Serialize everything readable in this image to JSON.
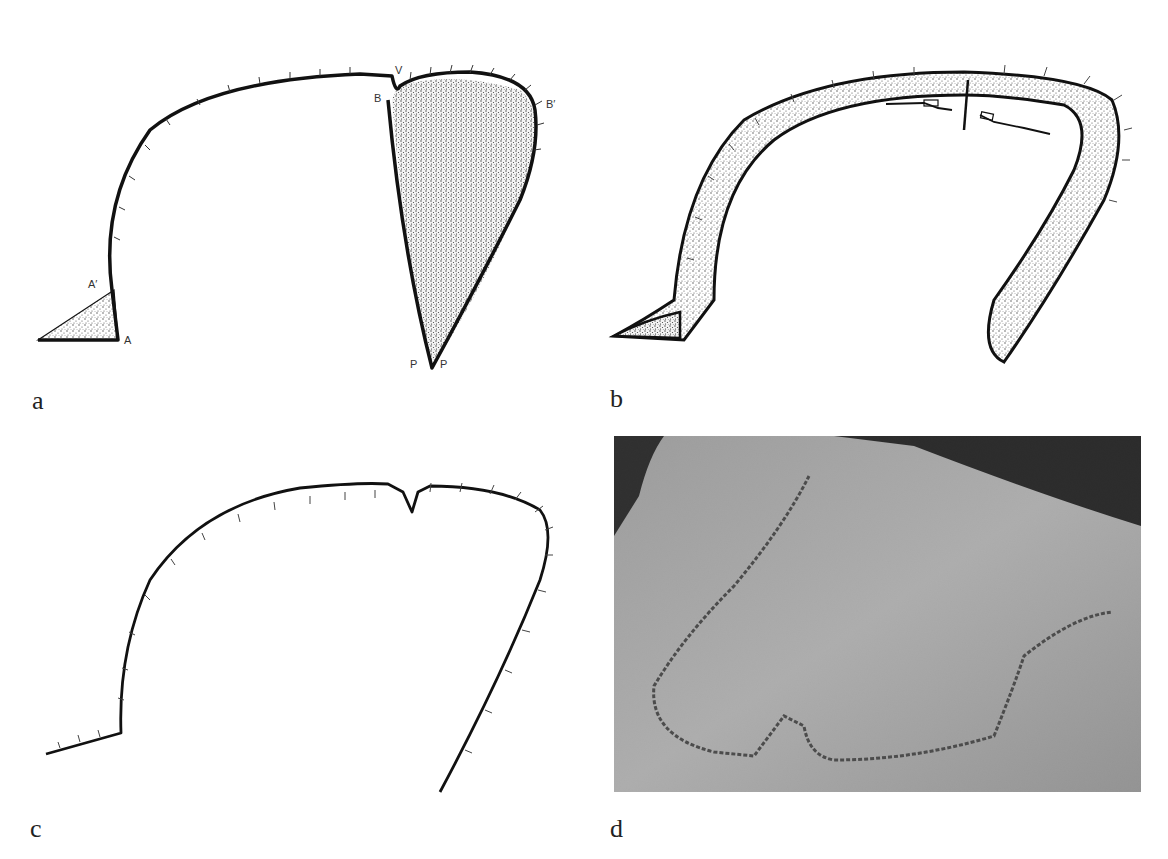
{
  "figure": {
    "panels": [
      {
        "id": "a",
        "label": "a",
        "type": "diagram",
        "point_labels": {
          "A": "A",
          "A_prime": "A′",
          "B": "B",
          "B_prime": "B′",
          "V": "V",
          "P_left": "P",
          "P_right": "P"
        }
      },
      {
        "id": "b",
        "label": "b",
        "type": "diagram"
      },
      {
        "id": "c",
        "label": "c",
        "type": "diagram"
      },
      {
        "id": "d",
        "label": "d",
        "type": "photograph"
      }
    ]
  },
  "colors": {
    "ink": "#111111",
    "stipple": "#555555",
    "background": "#ffffff",
    "photo_skin": "#b0b0b0",
    "photo_dark": "#111111"
  }
}
